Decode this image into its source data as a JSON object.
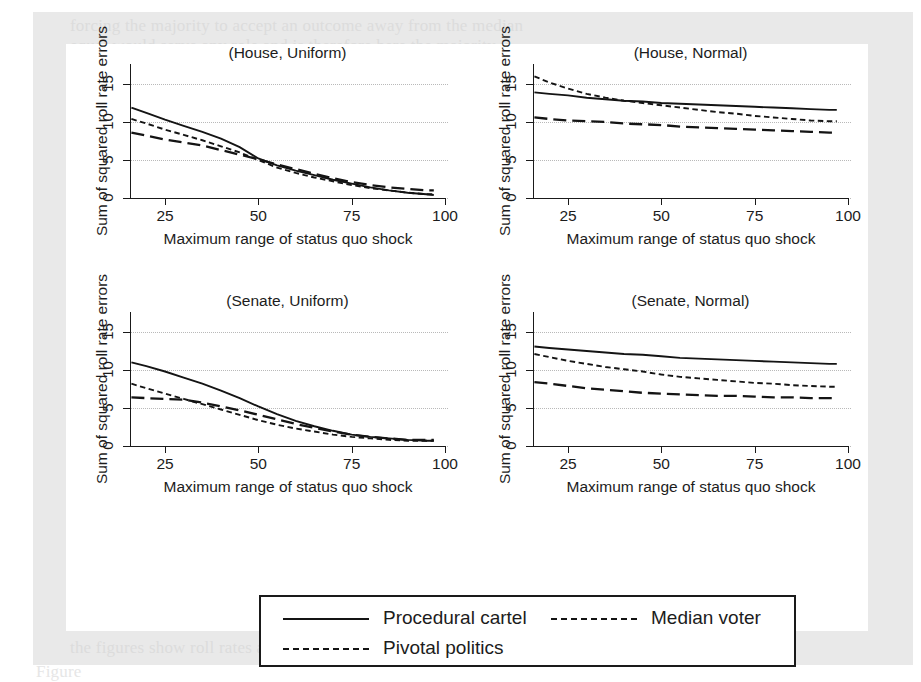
{
  "figure": {
    "background_color": "#ffffff",
    "page_tint": "#e9e9e9",
    "line_color": "#141414",
    "grid_color": "#b9b9b9"
  },
  "ghost_text": [
    {
      "text": "forcing the majority to accept an outcome away from the median",
      "x": 70,
      "y": 16,
      "class": "faint"
    },
    {
      "text": "equal would serve any role and is therefore here the majority is",
      "x": 70,
      "y": 36,
      "class": "faint"
    },
    {
      "text": "a chamber in which the  median  voter  also sets the agenda",
      "x": 80,
      "y": 330,
      "class": "vfaint"
    },
    {
      "text": "the third of our three models  of  legislative  organization",
      "x": 80,
      "y": 356,
      "class": "vfaint"
    },
    {
      "text": "procedural cartel, pivotal politics, and median voter",
      "x": 80,
      "y": 382,
      "class": "vfaint"
    },
    {
      "text": "roll rates are observed for the majority party under all of",
      "x": 80,
      "y": 470,
      "class": "vfaint"
    },
    {
      "text": "institutions would  matter  for  policy  outcomes. The",
      "x": 80,
      "y": 498,
      "class": "vfaint"
    },
    {
      "text": "is little or no evidence  that  agenda  setting  institutions",
      "x": 80,
      "y": 524,
      "class": "vfaint"
    },
    {
      "text": "analogies of  procedural cartel  as  well  as  the  three",
      "x": 80,
      "y": 546,
      "class": "vfaint"
    },
    {
      "text": "efficiently, however, both  figures  and  tables  replot",
      "x": 70,
      "y": 574,
      "class": "faint"
    },
    {
      "text": "the figures show roll rates against  the  maximum range",
      "x": 70,
      "y": 638,
      "class": "faint"
    },
    {
      "text": "Figure",
      "x": 36,
      "y": 662,
      "class": "vfaint"
    }
  ],
  "panels": [
    {
      "name": "house-uniform",
      "title": "(House, Uniform)",
      "xlabel": "Maximum range of status quo shock",
      "ylabel": "Sum of squared roll rate errors",
      "xticks": [
        25,
        50,
        75,
        100
      ],
      "yticks": [
        0,
        5,
        10,
        15
      ]
    },
    {
      "name": "house-normal",
      "title": "(House, Normal)",
      "xlabel": "Maximum range of status quo shock",
      "ylabel": "Sum of squared roll rate errors",
      "xticks": [
        25,
        50,
        75,
        100
      ],
      "yticks": [
        0,
        5,
        10,
        15
      ]
    },
    {
      "name": "senate-uniform",
      "title": "(Senate, Uniform)",
      "xlabel": "Maximum range of status quo shock",
      "ylabel": "Sum of squared roll rate errors",
      "xticks": [
        25,
        50,
        75,
        100
      ],
      "yticks": [
        0,
        5,
        10,
        15
      ]
    },
    {
      "name": "senate-normal",
      "title": "(Senate, Normal)",
      "xlabel": "Maximum range of status quo shock",
      "ylabel": "Sum of squared roll rate errors",
      "xticks": [
        25,
        50,
        75,
        100
      ],
      "yticks": [
        0,
        5,
        10,
        15
      ]
    }
  ],
  "legend": {
    "entries": [
      {
        "label": "Procedural cartel",
        "style": "solid"
      },
      {
        "label": "Median voter",
        "style": "long-dash"
      },
      {
        "label": "Pivotal politics",
        "style": "short-dash"
      }
    ]
  },
  "chart_data": {
    "type": "line",
    "title": "",
    "subplot_layout": "2x2",
    "xlabel": "Maximum range of status quo shock",
    "ylabel": "Sum of squared roll rate errors",
    "xlim": [
      14,
      102
    ],
    "ylim": [
      -1.5,
      17
    ],
    "xticks": [
      25,
      50,
      75,
      100
    ],
    "yticks": [
      0,
      5,
      10,
      15
    ],
    "grid": "horizontal-dotted",
    "legend_position": "below-figure",
    "series_styles": {
      "Procedural cartel": "solid",
      "Median voter": "long-dash",
      "Pivotal politics": "short-dash"
    },
    "subplots": [
      {
        "title": "(House, Uniform)",
        "x": [
          16,
          20,
          25,
          30,
          35,
          40,
          45,
          50,
          55,
          60,
          65,
          70,
          75,
          80,
          85,
          90,
          95,
          97
        ],
        "series": [
          {
            "name": "Procedural cartel",
            "values": [
              11.9,
              11.2,
              10.3,
              9.5,
              8.7,
              7.8,
              6.7,
              5.2,
              4.3,
              3.6,
              3.0,
              2.4,
              1.9,
              1.4,
              1.0,
              0.7,
              0.5,
              0.4
            ]
          },
          {
            "name": "Pivotal politics",
            "values": [
              10.4,
              9.8,
              9.0,
              8.3,
              7.6,
              6.8,
              6.0,
              5.0,
              4.0,
              3.3,
              2.7,
              2.2,
              1.7,
              1.3,
              1.0,
              0.7,
              0.5,
              0.5
            ]
          },
          {
            "name": "Median voter",
            "values": [
              8.6,
              8.2,
              7.7,
              7.3,
              6.9,
              6.3,
              5.7,
              5.1,
              4.4,
              3.8,
              3.2,
              2.6,
              2.1,
              1.7,
              1.4,
              1.2,
              1.0,
              1.0
            ]
          }
        ]
      },
      {
        "title": "(House, Normal)",
        "x": [
          16,
          20,
          25,
          30,
          35,
          40,
          45,
          50,
          55,
          60,
          65,
          70,
          75,
          80,
          85,
          90,
          95,
          97
        ],
        "series": [
          {
            "name": "Procedural cartel",
            "values": [
              13.9,
              13.7,
              13.5,
              13.2,
              13.0,
              12.8,
              12.7,
              12.5,
              12.4,
              12.3,
              12.2,
              12.1,
              12.0,
              11.9,
              11.8,
              11.7,
              11.6,
              11.6
            ]
          },
          {
            "name": "Pivotal politics",
            "values": [
              16.0,
              15.2,
              14.4,
              13.7,
              13.2,
              12.8,
              12.5,
              12.2,
              11.9,
              11.6,
              11.3,
              11.1,
              10.8,
              10.6,
              10.4,
              10.2,
              10.1,
              10.1
            ]
          },
          {
            "name": "Median voter",
            "values": [
              10.6,
              10.4,
              10.2,
              10.1,
              10.0,
              9.8,
              9.7,
              9.6,
              9.4,
              9.3,
              9.2,
              9.1,
              9.0,
              8.9,
              8.8,
              8.7,
              8.6,
              8.6
            ]
          }
        ]
      },
      {
        "title": "(Senate, Uniform)",
        "x": [
          16,
          20,
          25,
          30,
          35,
          40,
          45,
          50,
          55,
          60,
          65,
          70,
          75,
          80,
          85,
          90,
          95,
          97
        ],
        "series": [
          {
            "name": "Procedural cartel",
            "values": [
              11.0,
              10.5,
              9.8,
              9.0,
              8.2,
              7.3,
              6.3,
              5.2,
              4.2,
              3.3,
              2.6,
              2.0,
              1.5,
              1.2,
              1.0,
              0.8,
              0.7,
              0.7
            ]
          },
          {
            "name": "Pivotal politics",
            "values": [
              8.2,
              7.6,
              6.9,
              6.2,
              5.5,
              4.8,
              4.1,
              3.4,
              2.8,
              2.3,
              1.9,
              1.5,
              1.2,
              1.0,
              0.8,
              0.7,
              0.7,
              0.7
            ]
          },
          {
            "name": "Median voter",
            "values": [
              6.4,
              6.3,
              6.2,
              6.1,
              5.7,
              5.2,
              4.7,
              4.1,
              3.5,
              2.9,
              2.4,
              1.9,
              1.5,
              1.2,
              1.0,
              0.8,
              0.8,
              0.8
            ]
          }
        ]
      },
      {
        "title": "(Senate, Normal)",
        "x": [
          16,
          20,
          25,
          30,
          35,
          40,
          45,
          50,
          55,
          60,
          65,
          70,
          75,
          80,
          85,
          90,
          95,
          97
        ],
        "series": [
          {
            "name": "Procedural cartel",
            "values": [
              13.1,
              12.9,
              12.7,
              12.5,
              12.3,
              12.1,
              12.0,
              11.8,
              11.6,
              11.5,
              11.4,
              11.3,
              11.2,
              11.1,
              11.0,
              10.9,
              10.8,
              10.8
            ]
          },
          {
            "name": "Pivotal politics",
            "values": [
              12.1,
              11.7,
              11.2,
              10.8,
              10.4,
              10.1,
              9.8,
              9.4,
              9.1,
              8.9,
              8.7,
              8.5,
              8.3,
              8.2,
              8.0,
              7.9,
              7.8,
              7.8
            ]
          },
          {
            "name": "Median voter",
            "values": [
              8.4,
              8.2,
              7.9,
              7.6,
              7.4,
              7.2,
              7.0,
              6.9,
              6.8,
              6.7,
              6.6,
              6.6,
              6.5,
              6.4,
              6.4,
              6.3,
              6.3,
              6.3
            ]
          }
        ]
      }
    ]
  }
}
